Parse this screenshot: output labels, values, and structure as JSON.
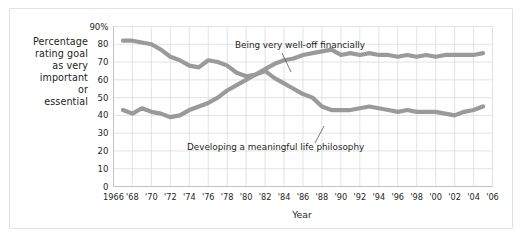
{
  "figure": {
    "y_axis_title_lines": [
      "Percentage",
      "rating goal",
      "as very",
      "important",
      "or",
      "essential"
    ],
    "x_axis_label": "Year",
    "annotations": [
      {
        "name": "series-label-financial",
        "text": "Being very well-off financially"
      },
      {
        "name": "series-label-philosophy",
        "text": "Developing a meaningful life philosophy"
      }
    ],
    "colors": {
      "line": "#9a9a9a",
      "grid": "#d4d7dc",
      "axis": "#bfc3c8",
      "text": "#231f20",
      "frame": "#e2e2e2",
      "background": "#ffffff"
    }
  },
  "chart_data": {
    "type": "line",
    "title": "",
    "subtitle": "",
    "xlabel": "Year",
    "ylabel": "Percentage rating goal as very important or essential",
    "xlim": [
      1966,
      2006
    ],
    "ylim": [
      0,
      90
    ],
    "grid": true,
    "legend_position": "inline-annotations",
    "ytick_labels": [
      "90%",
      "80",
      "70",
      "60",
      "50",
      "40",
      "30",
      "20",
      "10",
      "0"
    ],
    "ytick_values": [
      90,
      80,
      70,
      60,
      50,
      40,
      30,
      20,
      10,
      0
    ],
    "xtick_labels": [
      "1966",
      "'68",
      "'70",
      "'72",
      "'74",
      "'76",
      "'78",
      "'80",
      "'82",
      "'84",
      "'86",
      "'88",
      "'90",
      "'92",
      "'94",
      "'96",
      "'98",
      "'00",
      "'02",
      "'04",
      "'06"
    ],
    "xtick_values": [
      1966,
      1968,
      1970,
      1972,
      1974,
      1976,
      1978,
      1980,
      1982,
      1984,
      1986,
      1988,
      1990,
      1992,
      1994,
      1996,
      1998,
      2000,
      2002,
      2004,
      2006
    ],
    "x": [
      1967,
      1968,
      1969,
      1970,
      1971,
      1972,
      1973,
      1974,
      1975,
      1976,
      1977,
      1978,
      1979,
      1980,
      1981,
      1982,
      1983,
      1984,
      1985,
      1986,
      1987,
      1988,
      1989,
      1990,
      1991,
      1992,
      1993,
      1994,
      1995,
      1996,
      1997,
      1998,
      1999,
      2000,
      2001,
      2002,
      2003,
      2004,
      2005
    ],
    "series": [
      {
        "name": "Developing a meaningful life philosophy",
        "values": [
          82,
          82,
          81,
          80,
          77,
          73,
          71,
          68,
          67,
          71,
          70,
          68,
          64,
          62,
          63,
          65,
          61,
          58,
          55,
          52,
          50,
          45,
          43,
          43,
          43,
          44,
          45,
          44,
          43,
          42,
          43,
          42,
          42,
          42,
          41,
          40,
          42,
          43,
          45
        ]
      },
      {
        "name": "Being very well-off financially",
        "values": [
          43,
          41,
          44,
          42,
          41,
          39,
          40,
          43,
          45,
          47,
          50,
          54,
          57,
          60,
          63,
          66,
          69,
          71,
          72,
          74,
          75,
          76,
          77,
          74,
          75,
          74,
          75,
          74,
          74,
          73,
          74,
          73,
          74,
          73,
          74,
          74,
          74,
          74,
          75
        ]
      }
    ]
  }
}
